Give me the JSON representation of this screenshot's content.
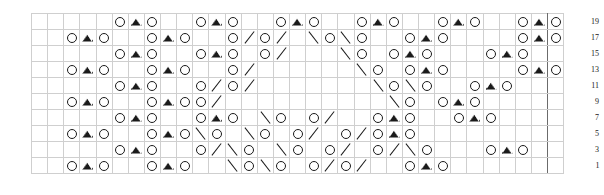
{
  "chart": {
    "columns": 33,
    "rows": 10,
    "cell_size_px": 17,
    "grid_line_color": "#cfcfcf",
    "repeat_line_color": "#6b6b6b",
    "symbol_color": "#1a1a1a",
    "background": "#ffffff",
    "repeat_left_col": 2,
    "repeat_right_col": 31,
    "legend": {
      "o": "yarn-over",
      "v": "centered-double-decrease",
      "r": "right-leaning-decrease",
      "l": "left-leaning-decrease",
      "k": "knit-blank"
    },
    "row_labels": [
      "19",
      "17",
      "15",
      "13",
      "11",
      "9",
      "7",
      "5",
      "3",
      "1"
    ],
    "grid": [
      [
        "k",
        "k",
        "k",
        "k",
        "k",
        "o",
        "v",
        "o",
        "k",
        "k",
        "o",
        "v",
        "o",
        "k",
        "k",
        "o",
        "v",
        "o",
        "k",
        "k",
        "o",
        "v",
        "o",
        "k",
        "k",
        "o",
        "v",
        "o",
        "k",
        "k",
        "o",
        "v",
        "o"
      ],
      [
        "k",
        "k",
        "o",
        "v",
        "o",
        "k",
        "k",
        "o",
        "v",
        "o",
        "k",
        "k",
        "o",
        "r",
        "o",
        "r",
        "k",
        "l",
        "o",
        "l",
        "o",
        "k",
        "k",
        "o",
        "v",
        "o",
        "k",
        "k",
        "k",
        "k",
        "o",
        "v",
        "o"
      ],
      [
        "k",
        "k",
        "k",
        "k",
        "k",
        "o",
        "v",
        "o",
        "k",
        "k",
        "o",
        "v",
        "o",
        "k",
        "o",
        "r",
        "k",
        "k",
        "k",
        "l",
        "o",
        "k",
        "o",
        "v",
        "o",
        "k",
        "k",
        "k",
        "o",
        "v",
        "o",
        "k",
        "k"
      ],
      [
        "k",
        "k",
        "o",
        "v",
        "o",
        "k",
        "k",
        "o",
        "v",
        "o",
        "k",
        "k",
        "o",
        "r",
        "k",
        "k",
        "k",
        "k",
        "k",
        "k",
        "l",
        "o",
        "k",
        "o",
        "v",
        "o",
        "k",
        "k",
        "k",
        "k",
        "o",
        "v",
        "o"
      ],
      [
        "k",
        "k",
        "k",
        "k",
        "k",
        "o",
        "v",
        "o",
        "k",
        "k",
        "o",
        "r",
        "o",
        "r",
        "k",
        "k",
        "k",
        "k",
        "k",
        "k",
        "k",
        "l",
        "o",
        "l",
        "o",
        "k",
        "k",
        "o",
        "v",
        "o",
        "k",
        "k",
        "k"
      ],
      [
        "k",
        "k",
        "o",
        "v",
        "o",
        "k",
        "k",
        "o",
        "v",
        "o",
        "o",
        "r",
        "k",
        "k",
        "k",
        "k",
        "k",
        "k",
        "k",
        "k",
        "k",
        "k",
        "l",
        "o",
        "k",
        "o",
        "v",
        "o",
        "k",
        "k",
        "k",
        "k",
        "k"
      ],
      [
        "k",
        "k",
        "k",
        "k",
        "k",
        "o",
        "v",
        "o",
        "k",
        "k",
        "o",
        "v",
        "o",
        "k",
        "l",
        "o",
        "k",
        "o",
        "r",
        "k",
        "k",
        "o",
        "v",
        "o",
        "k",
        "k",
        "o",
        "v",
        "o",
        "k",
        "k",
        "k",
        "k"
      ],
      [
        "k",
        "k",
        "o",
        "v",
        "o",
        "k",
        "k",
        "o",
        "v",
        "o",
        "l",
        "o",
        "k",
        "l",
        "o",
        "k",
        "o",
        "r",
        "k",
        "o",
        "r",
        "o",
        "v",
        "o",
        "k",
        "k",
        "k",
        "k",
        "k",
        "k",
        "k",
        "k",
        "k"
      ],
      [
        "k",
        "k",
        "k",
        "k",
        "k",
        "o",
        "v",
        "o",
        "k",
        "k",
        "o",
        "r",
        "l",
        "o",
        "k",
        "l",
        "o",
        "k",
        "o",
        "r",
        "k",
        "o",
        "r",
        "l",
        "o",
        "k",
        "k",
        "k",
        "o",
        "v",
        "o",
        "k",
        "k"
      ],
      [
        "k",
        "k",
        "o",
        "v",
        "o",
        "k",
        "k",
        "o",
        "v",
        "o",
        "k",
        "k",
        "l",
        "o",
        "l",
        "o",
        "k",
        "o",
        "r",
        "o",
        "r",
        "k",
        "k",
        "o",
        "v",
        "o",
        "k",
        "k",
        "k",
        "k",
        "k",
        "k",
        "k"
      ]
    ]
  }
}
